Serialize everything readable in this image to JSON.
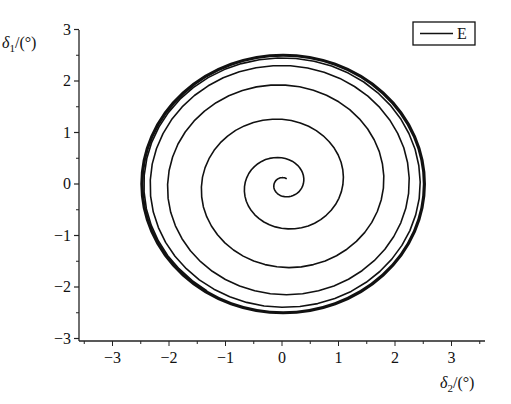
{
  "chart_data": {
    "type": "line",
    "title": "",
    "xlabel": "δ2/(°)",
    "ylabel": "δ1/(°)",
    "xlabel_parts": {
      "sym": "δ",
      "sub": "2",
      "unit": "/(°)"
    },
    "ylabel_parts": {
      "sym": "δ",
      "sub": "1",
      "unit": "/(°)"
    },
    "xlim": [
      -3.6,
      3.6
    ],
    "ylim": [
      -3,
      3
    ],
    "xticks": [
      -3,
      -2,
      -1,
      0,
      1,
      2,
      3
    ],
    "yticks": [
      -3,
      -2,
      -1,
      0,
      1,
      2,
      3
    ],
    "xtick_labels": [
      "−3",
      "−2",
      "−1",
      "0",
      "1",
      "2",
      "3"
    ],
    "ytick_labels": [
      "−3",
      "−2",
      "−1",
      "0",
      "1",
      "2",
      "3"
    ],
    "grid": false,
    "legend": {
      "position": "top-right",
      "entries": [
        "E"
      ]
    },
    "series": [
      {
        "name": "E",
        "color": "#111111",
        "description": "Phase trajectory spiralling outward from near origin (0.15, 0.2) to a limit cycle of radius ≈ 2.5",
        "spiral": {
          "start_x": 0.15,
          "start_y": 0.2,
          "r_start": 0.12,
          "r_limit": 2.5,
          "turns": 5.5,
          "center_x": 0.02,
          "center_y": 0.0
        },
        "limit_cycle_radius": 2.5
      }
    ]
  },
  "plot": {
    "x0_px": 282,
    "x_per_unit": 56.5,
    "y0_px": 184,
    "y_per_unit": 51.5,
    "axis_left_px": 79,
    "axis_bottom_px": 341,
    "axis_right_px": 485,
    "axis_top_px": 30
  }
}
